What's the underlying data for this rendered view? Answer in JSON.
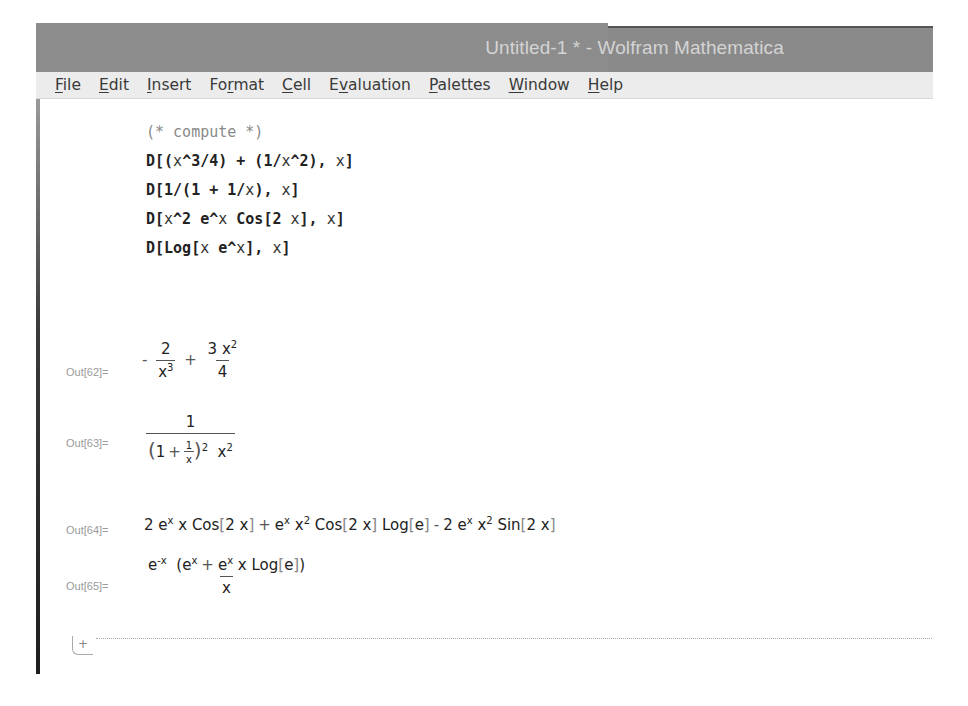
{
  "window": {
    "title": "Untitled-1 * - Wolfram Mathematica"
  },
  "menubar": {
    "items": [
      {
        "label": "File",
        "accel": "F"
      },
      {
        "label": "Edit",
        "accel": "E"
      },
      {
        "label": "Insert",
        "accel": "I"
      },
      {
        "label": "Format",
        "accel": "r"
      },
      {
        "label": "Cell",
        "accel": "C"
      },
      {
        "label": "Evaluation",
        "accel": "v"
      },
      {
        "label": "Palettes",
        "accel": "P"
      },
      {
        "label": "Window",
        "accel": "W"
      },
      {
        "label": "Help",
        "accel": "H"
      }
    ]
  },
  "input_cell": {
    "comment": "(* compute *)",
    "lines": [
      "D[(x^3/4) + (1/x^2), x]",
      "D[1/(1 + 1/x), x]",
      "D[x^2 e^x Cos[2 x], x]",
      "D[Log[x e^x], x]"
    ]
  },
  "outputs": [
    {
      "label": "Out[62]=",
      "text": "-2/x^3 + 3 x^2/4"
    },
    {
      "label": "Out[63]=",
      "text": "1/((1 + 1/x)^2 x^2)"
    },
    {
      "label": "Out[64]=",
      "text": "2 e^x x Cos[2 x] + e^x x^2 Cos[2 x] Log[e] - 2 e^x x^2 Sin[2 x]"
    },
    {
      "label": "Out[65]=",
      "text": "e^-x (e^x + e^x x Log[e]) / x"
    }
  ],
  "insertion_point": {
    "icon": "plus-icon",
    "symbol": "+"
  }
}
